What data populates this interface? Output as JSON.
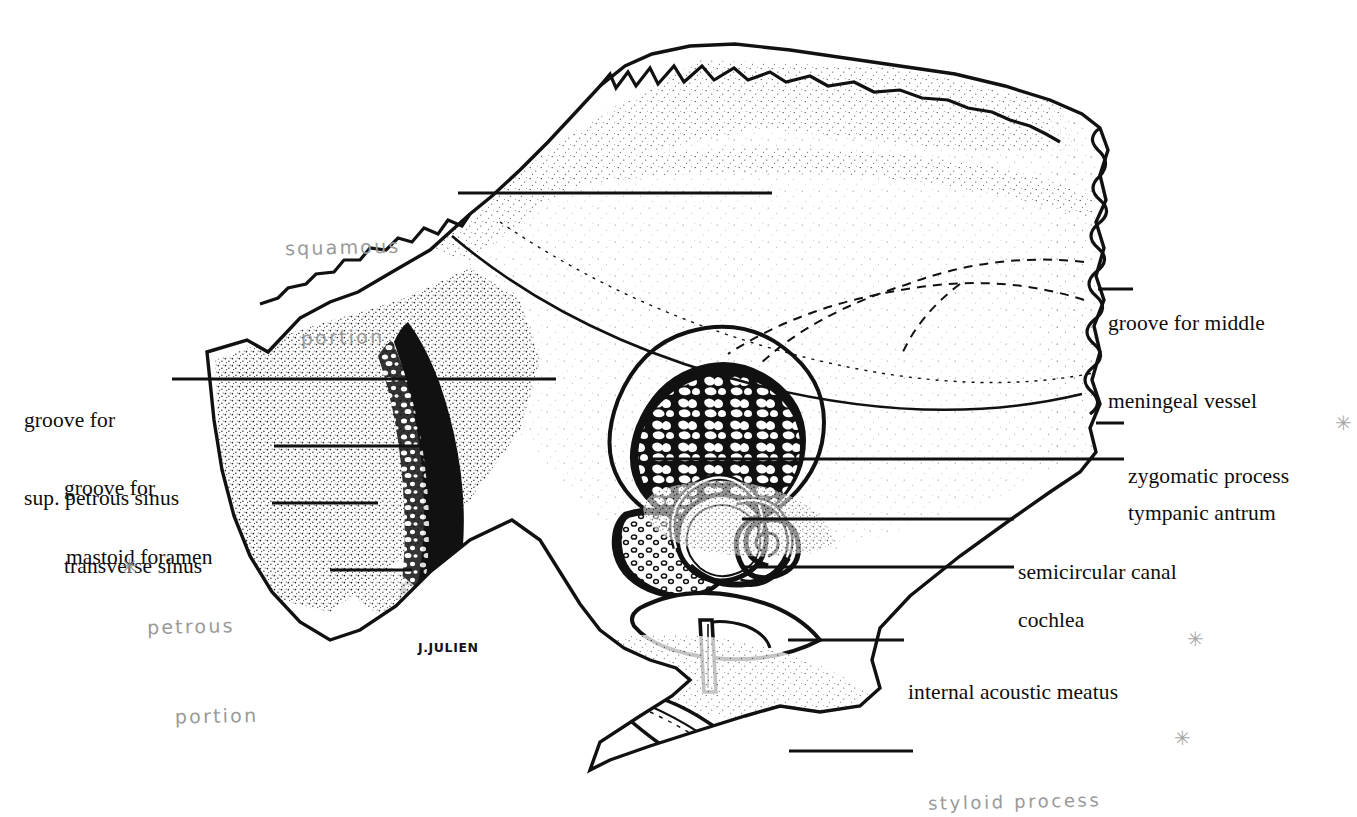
{
  "figure": {
    "signature": "J.JULIEN",
    "ink_color": "#111111",
    "pencil_color": "#9a9a9a",
    "background": "#ffffff"
  },
  "printed_labels": [
    {
      "id": "groove-for-middle-meningeal-vessel",
      "lines": [
        "groove for middle",
        "meningeal vessel"
      ],
      "side": "right",
      "x": 1108,
      "y": 258,
      "leader": {
        "x1": 1098,
        "y1": 289,
        "x2": 1133,
        "y2": 289
      }
    },
    {
      "id": "groove-for-sup-petrous-sinus",
      "lines": [
        "groove for",
        "sup. petrous sinus"
      ],
      "side": "left",
      "x": 24,
      "y": 355,
      "leader": {
        "x1": 172,
        "y1": 379,
        "x2": 556,
        "y2": 379
      }
    },
    {
      "id": "groove-for-transverse-sinus",
      "lines": [
        "groove for",
        "transverse sinus"
      ],
      "side": "left",
      "x": 64,
      "y": 423,
      "leader": {
        "x1": 274,
        "y1": 446,
        "x2": 430,
        "y2": 446
      }
    },
    {
      "id": "mastoid-foramen",
      "lines": [
        "mastoid foramen"
      ],
      "side": "left",
      "x": 66,
      "y": 492,
      "leader": {
        "x1": 272,
        "y1": 503,
        "x2": 378,
        "y2": 503
      }
    },
    {
      "id": "zygomatic-process",
      "lines": [
        "zygomatic process"
      ],
      "side": "right",
      "x": 1128,
      "y": 411,
      "leader": {
        "x1": 1096,
        "y1": 423,
        "x2": 1124,
        "y2": 423
      }
    },
    {
      "id": "tympanic-antrum",
      "lines": [
        "tympanic antrum"
      ],
      "side": "right",
      "x": 1128,
      "y": 448,
      "leader": {
        "x1": 651,
        "y1": 459,
        "x2": 1124,
        "y2": 459
      }
    },
    {
      "id": "semicircular-canal",
      "lines": [
        "semicircular canal"
      ],
      "side": "right",
      "x": 1018,
      "y": 507,
      "leader": {
        "x1": 742,
        "y1": 519,
        "x2": 1014,
        "y2": 519
      }
    },
    {
      "id": "cochlea",
      "lines": [
        "cochlea"
      ],
      "side": "right",
      "x": 1018,
      "y": 555,
      "leader": {
        "x1": 742,
        "y1": 567,
        "x2": 1014,
        "y2": 567
      }
    },
    {
      "id": "internal-acoustic-meatus",
      "lines": [
        "internal acoustic meatus"
      ],
      "side": "right",
      "x": 908,
      "y": 627,
      "leader": {
        "x1": 788,
        "y1": 640,
        "x2": 904,
        "y2": 640
      }
    }
  ],
  "handwritten_labels": [
    {
      "id": "squamous-portion",
      "lines": [
        "squamous",
        "portion"
      ],
      "x": 286,
      "y": 172,
      "leader": {
        "x1": 458,
        "y1": 193,
        "x2": 772,
        "y2": 193
      },
      "star": null
    },
    {
      "id": "petrous-portion",
      "lines": [
        "petrous",
        "portion"
      ],
      "x": 148,
      "y": 551,
      "leader": {
        "x1": 330,
        "y1": 570,
        "x2": 412,
        "y2": 570
      },
      "star": {
        "x": 121,
        "y": 556,
        "glyph": "✳"
      }
    },
    {
      "id": "styloid-process",
      "lines": [
        "styloid process"
      ],
      "x": 928,
      "y": 727,
      "leader": {
        "x1": 789,
        "y1": 751,
        "x2": 913,
        "y2": 751
      },
      "star": {
        "x": 1174,
        "y": 728,
        "glyph": "✳"
      }
    }
  ],
  "margin_marks": [
    {
      "id": "mark-zygomatic-process",
      "x": 1335,
      "y": 413,
      "glyph": "✳"
    },
    {
      "id": "mark-internal-acoustic-meatus",
      "x": 1187,
      "y": 629,
      "glyph": "✳"
    }
  ],
  "signature": {
    "text": "J.JULIEN",
    "x": 418,
    "y": 640
  }
}
